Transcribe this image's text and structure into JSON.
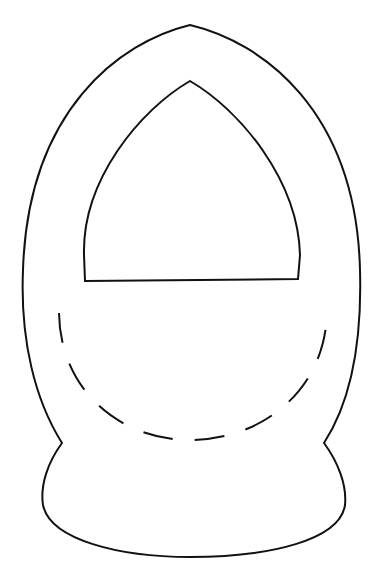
{
  "image": {
    "subject": "basket template line drawing",
    "width": 373,
    "height": 587,
    "background": "#ffffff",
    "stroke_color": "#111111",
    "parts": [
      {
        "id": "outer-outline",
        "style": "solid"
      },
      {
        "id": "handle-window",
        "style": "solid"
      },
      {
        "id": "fold-line",
        "style": "dashed"
      }
    ]
  }
}
